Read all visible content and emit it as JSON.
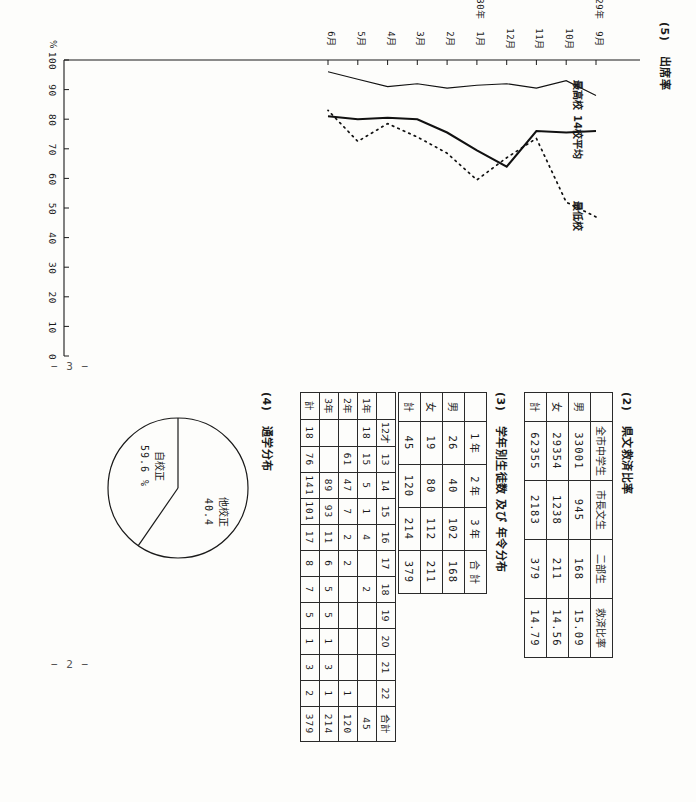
{
  "page": {
    "folio_left": "− 3 −",
    "folio_right": "− 2 −"
  },
  "section2": {
    "number": "(2)",
    "title": "県文救済比率",
    "columns": [
      "",
      "全市中学生",
      "市長文生",
      "二部生",
      "救済比率"
    ],
    "rows": [
      {
        "label": "男",
        "cells": [
          "33001",
          "945",
          "168",
          "15.09"
        ]
      },
      {
        "label": "女",
        "cells": [
          "29354",
          "1238",
          "211",
          "14.56"
        ]
      },
      {
        "label": "計",
        "cells": [
          "62355",
          "2183",
          "379",
          "14.79"
        ]
      }
    ]
  },
  "section3": {
    "number": "(3)",
    "title": "学年別生徒数 及び 年令分布",
    "grade_table": {
      "columns": [
        "",
        "1 年",
        "2 年",
        "3 年",
        "合 計"
      ],
      "rows": [
        {
          "label": "男",
          "cells": [
            "26",
            "40",
            "102",
            "168"
          ]
        },
        {
          "label": "女",
          "cells": [
            "19",
            "80",
            "112",
            "211"
          ]
        },
        {
          "label": "計",
          "cells": [
            "45",
            "120",
            "214",
            "379"
          ]
        }
      ]
    },
    "age_table": {
      "columns": [
        "",
        "12才",
        "13",
        "14",
        "15",
        "16",
        "17",
        "18",
        "19",
        "20",
        "21",
        "22",
        "合計"
      ],
      "rows": [
        {
          "label": "1年",
          "cells": [
            "18",
            "15",
            "5",
            "1",
            "4",
            "",
            "2",
            "",
            "",
            "",
            "",
            "45"
          ]
        },
        {
          "label": "2年",
          "cells": [
            "",
            "61",
            "47",
            "7",
            "2",
            "2",
            "",
            "",
            "",
            "",
            "1",
            "120"
          ]
        },
        {
          "label": "3年",
          "cells": [
            "",
            "",
            "89",
            "93",
            "11",
            "6",
            "5",
            "5",
            "1",
            "3",
            "1",
            "214"
          ]
        },
        {
          "label": "計",
          "cells": [
            "18",
            "76",
            "141",
            "101",
            "17",
            "8",
            "7",
            "5",
            "1",
            "3",
            "2",
            "379"
          ]
        }
      ]
    }
  },
  "section4": {
    "number": "(4)",
    "title": "通学分布",
    "chart_data": {
      "type": "pie",
      "title": "通学分布",
      "labels": [
        "自校正",
        "他校正"
      ],
      "values": [
        59.6,
        40.4
      ],
      "value_texts": [
        "59.6 %",
        "40.4"
      ],
      "unit": "%",
      "legend": "inside"
    }
  },
  "section5": {
    "number": "(5)",
    "title": "出席率",
    "chart_data": {
      "type": "line",
      "title": "出席率",
      "ylabel": "%",
      "xlabel": "",
      "ylim": [
        0,
        100
      ],
      "yticks": [
        100,
        90,
        80,
        70,
        60,
        50,
        40,
        30,
        20,
        10,
        0
      ],
      "grid": false,
      "legend": "inline-labels",
      "x": [
        "9月",
        "10月",
        "11月",
        "12月",
        "1月",
        "2月",
        "3月",
        "4月",
        "5月",
        "6月"
      ],
      "x_year_marks": [
        {
          "index": 0,
          "text": "29年"
        },
        {
          "index": 4,
          "text": "30年"
        }
      ],
      "series": [
        {
          "name": "最高校",
          "style": "solid-thin",
          "values": [
            88,
            93,
            90.5,
            92,
            91.5,
            90.5,
            92,
            91,
            93.5,
            96
          ]
        },
        {
          "name": "14校平均",
          "style": "solid-thick",
          "values": [
            76,
            75.5,
            76,
            64,
            69.5,
            75.5,
            80,
            80.5,
            80,
            81
          ]
        },
        {
          "name": "最低校",
          "style": "dotted",
          "values": [
            47,
            52,
            73.5,
            67,
            59.5,
            68.5,
            74,
            78.5,
            72.5,
            83
          ]
        }
      ]
    }
  }
}
